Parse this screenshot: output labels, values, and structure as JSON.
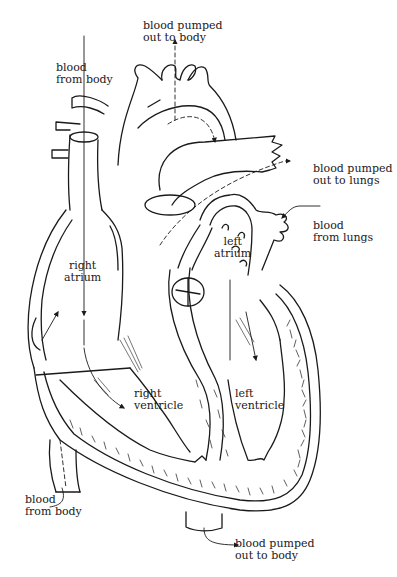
{
  "diagram": {
    "line_color": "#1a1a1a",
    "background": "#ffffff",
    "labels": {
      "aorta_top": {
        "line1": "blood pumped",
        "line2": "out to body"
      },
      "vena_cava_superior": {
        "line1": "blood",
        "line2": "from body"
      },
      "pulmonary_artery": {
        "line1": "blood pumped",
        "line2": "out to lungs"
      },
      "pulmonary_vein": {
        "line1": "blood",
        "line2": "from lungs"
      },
      "right_atrium": {
        "line1": "right",
        "line2": "atrium"
      },
      "left_atrium": {
        "line1": "left",
        "line2": "atrium"
      },
      "right_ventricle": {
        "line1": "right",
        "line2": "ventricle"
      },
      "left_ventricle": {
        "line1": "left",
        "line2": "ventricle"
      },
      "vena_cava_inferior": {
        "line1": "blood",
        "line2": "from body"
      },
      "aorta_bottom": {
        "line1": "blood pumped",
        "line2": "out to body"
      }
    }
  }
}
